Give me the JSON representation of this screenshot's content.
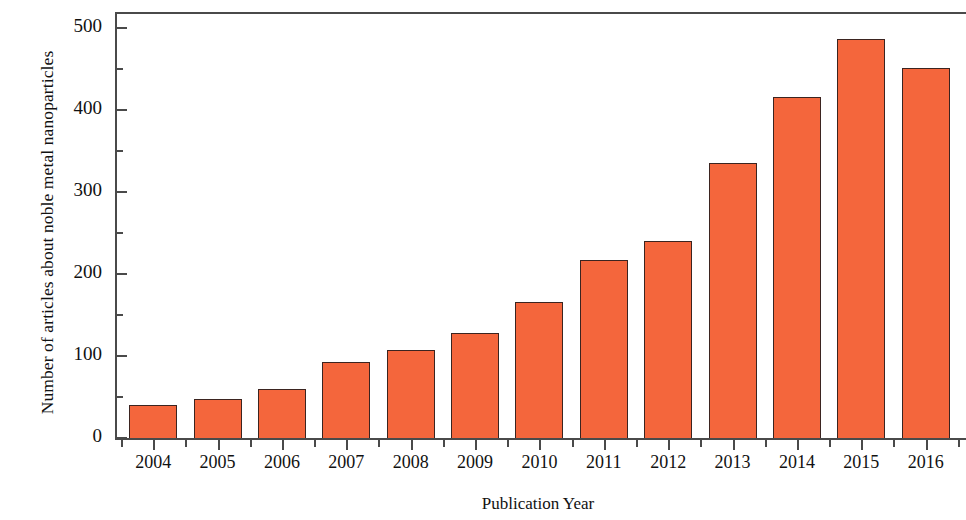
{
  "chart_data": {
    "type": "bar",
    "title": "",
    "xlabel": "Publication Year",
    "ylabel": "Number of articles about noble metal nanoparticles",
    "categories": [
      "2004",
      "2005",
      "2006",
      "2007",
      "2008",
      "2009",
      "2010",
      "2011",
      "2012",
      "2013",
      "2014",
      "2015",
      "2016"
    ],
    "values": [
      40,
      48,
      60,
      93,
      107,
      128,
      166,
      217,
      240,
      336,
      416,
      487,
      452
    ],
    "ylim": [
      0,
      520
    ],
    "y_major_ticks": [
      0,
      100,
      200,
      300,
      400,
      500
    ],
    "y_minor_ticks": [
      50,
      150,
      250,
      350,
      450
    ],
    "y_tick_labels": [
      "0",
      "100",
      "200",
      "300",
      "400",
      "500"
    ],
    "grid": false,
    "legend": false,
    "bar_color": "#f4663c",
    "bar_edge_color": "#3b2420",
    "axis_color": "#4a4a4a"
  }
}
